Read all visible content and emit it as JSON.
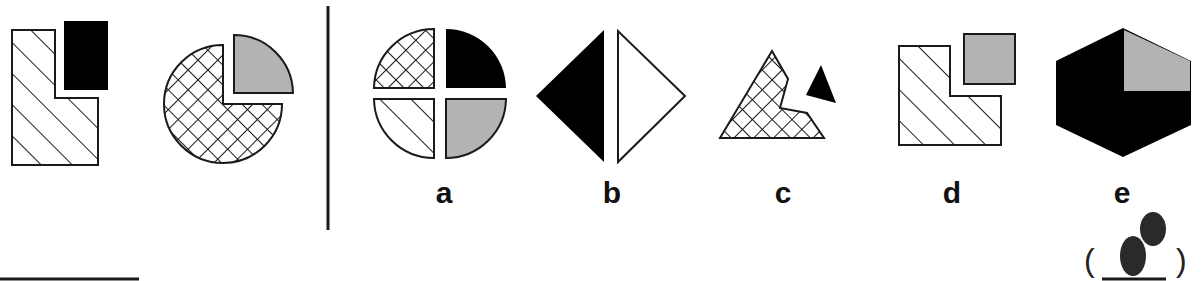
{
  "puzzle": {
    "given_figures": [
      {
        "id": "given-1",
        "description": "hatched L-shape with black rectangle"
      },
      {
        "id": "given-2",
        "description": "crosshatched circle with gray quarter sector"
      }
    ],
    "options": [
      {
        "label": "a",
        "x": 444
      },
      {
        "label": "b",
        "x": 612
      },
      {
        "label": "c",
        "x": 783
      },
      {
        "label": "d",
        "x": 952
      },
      {
        "label": "e",
        "x": 1122
      }
    ],
    "answer_blank": {
      "open": "(",
      "close": ")"
    },
    "colors": {
      "black": "#000000",
      "gray": "#b3b3b3",
      "line": "#1a1a1a"
    }
  }
}
